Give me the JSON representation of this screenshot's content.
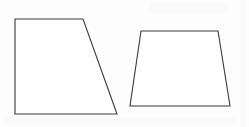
{
  "figure": {
    "canvas": {
      "width": 249,
      "height": 127,
      "background_color": "#fdfdfd"
    },
    "stroke": {
      "color": "#3a3a3a",
      "width": 1.1
    },
    "fill_color": "#ffffff",
    "shapes": [
      {
        "id": "left-trapezoid",
        "name": "Left trapezoid",
        "type": "right trapezoid",
        "points": "15,19 83,19 117,114 15,114",
        "vertices": [
          {
            "label": "top-left",
            "x": 15,
            "y": 19
          },
          {
            "label": "top-right",
            "x": 83,
            "y": 19
          },
          {
            "label": "bottom-right",
            "x": 117,
            "y": 114
          },
          {
            "label": "bottom-left",
            "x": 15,
            "y": 114
          }
        ],
        "top_width": 68,
        "bottom_width": 102,
        "height": 95
      },
      {
        "id": "right-trapezoid",
        "name": "Right trapezoid",
        "type": "isosceles trapezoid",
        "points": "141,31 218,31 230,106 130,106",
        "vertices": [
          {
            "label": "top-left",
            "x": 141,
            "y": 31
          },
          {
            "label": "top-right",
            "x": 218,
            "y": 31
          },
          {
            "label": "bottom-right",
            "x": 230,
            "y": 106
          },
          {
            "label": "bottom-left",
            "x": 130,
            "y": 106
          }
        ],
        "top_width": 77,
        "bottom_width": 100,
        "height": 75
      }
    ],
    "artifacts": [
      {
        "id": "artifact-top-right",
        "name": "faint-scan-bleed-top-right"
      },
      {
        "id": "artifact-bottom-band",
        "name": "faint-scan-bleed-bottom"
      },
      {
        "id": "artifact-right-edge",
        "name": "faint-scan-edge-right"
      }
    ]
  }
}
